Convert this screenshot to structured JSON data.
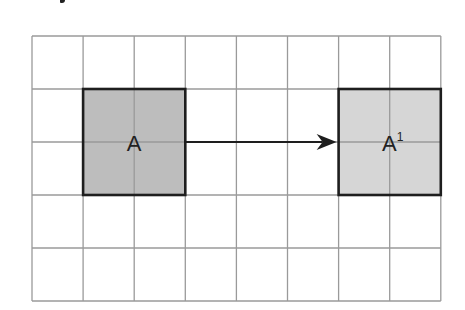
{
  "diagram": {
    "type": "grid-translation",
    "grid": {
      "columns": 8,
      "rows": 5,
      "left": 32,
      "top": 36,
      "cell_width": 51.1,
      "cell_height": 53,
      "line_color": "#9a9a9a"
    },
    "shapes": [
      {
        "id": "original",
        "label": "A",
        "superscript": "",
        "col": 1,
        "row": 1,
        "width_cells": 2,
        "height_cells": 2,
        "fill": "#bdbdbd",
        "border": "#1e1e1e"
      },
      {
        "id": "image",
        "label": "A",
        "superscript": "1",
        "col": 6,
        "row": 1,
        "width_cells": 2,
        "height_cells": 2,
        "fill": "#d6d6d6",
        "border": "#1e1e1e"
      }
    ],
    "arrow": {
      "from": "original",
      "to": "image",
      "direction": "right",
      "color": "#1e1e1e"
    }
  }
}
